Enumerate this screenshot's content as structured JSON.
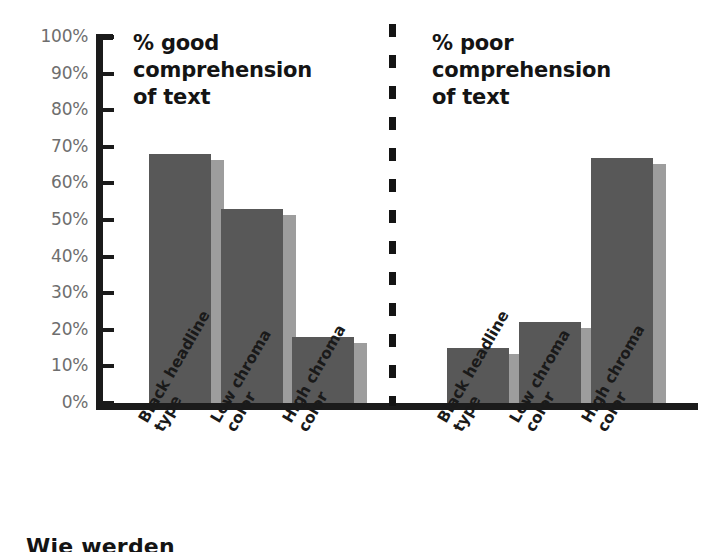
{
  "chart_data": {
    "type": "bar",
    "title": "",
    "xlabel": "",
    "ylabel": "",
    "ylim": [
      0,
      100
    ],
    "grid": false,
    "legend_position": "none",
    "y_ticks": [
      "100%",
      "90%",
      "80%",
      "70%",
      "60%",
      "50%",
      "40%",
      "30%",
      "20%",
      "10%",
      "0%"
    ],
    "y_tick_values": [
      100,
      90,
      80,
      70,
      60,
      50,
      40,
      30,
      20,
      10,
      0
    ],
    "categories": [
      "Black headline type",
      "Low chroma color",
      "High chroma color"
    ],
    "panels": [
      {
        "title": "% good\ncomprehension\nof text",
        "values": [
          68,
          53,
          18
        ]
      },
      {
        "title": "% poor\ncomprehension\nof text",
        "values": [
          15,
          22,
          67
        ]
      }
    ]
  },
  "axis": {
    "y_ticks": [
      {
        "label": "100%",
        "value": 100
      },
      {
        "label": "90%",
        "value": 90
      },
      {
        "label": "80%",
        "value": 80
      },
      {
        "label": "70%",
        "value": 70
      },
      {
        "label": "60%",
        "value": 60
      },
      {
        "label": "50%",
        "value": 50
      },
      {
        "label": "40%",
        "value": 40
      },
      {
        "label": "30%",
        "value": 30
      },
      {
        "label": "20%",
        "value": 20
      },
      {
        "label": "10%",
        "value": 10
      },
      {
        "label": "0%",
        "value": 0
      }
    ]
  },
  "categories": [
    {
      "line1": "Black headline",
      "line2": "type"
    },
    {
      "line1": "Low chroma",
      "line2": "color"
    },
    {
      "line1": "High chroma",
      "line2": "color"
    }
  ],
  "panels": {
    "left": {
      "title": "% good\ncomprehension\nof text",
      "bars": [
        {
          "category": "Black headline type",
          "value": 68
        },
        {
          "category": "Low chroma color",
          "value": 53
        },
        {
          "category": "High chroma color",
          "value": 18
        }
      ]
    },
    "right": {
      "title": "% poor\ncomprehension\nof text",
      "bars": [
        {
          "category": "Black headline type",
          "value": 15
        },
        {
          "category": "Low chroma color",
          "value": 22
        },
        {
          "category": "High chroma color",
          "value": 67
        }
      ]
    }
  },
  "colors": {
    "bar_front": "#585858",
    "bar_side": "#9d9d9d",
    "axis": "#1b1b1b",
    "tick_label": "#6e6e6e",
    "title": "#141414",
    "background": "#ffffff"
  },
  "bottom_caption": "Wie werden"
}
